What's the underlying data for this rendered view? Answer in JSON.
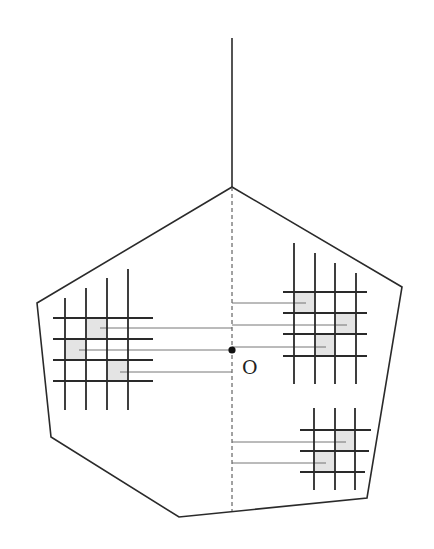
{
  "diagram": {
    "width": 434,
    "height": 549,
    "colors": {
      "stroke": "#2a2a2a",
      "thin": "#555555",
      "shade": "#e4e4e4",
      "background": "#ffffff"
    },
    "stem": {
      "x": 232,
      "y1": 38,
      "y2": 187
    },
    "pentagon": [
      [
        232,
        187
      ],
      [
        402,
        287
      ],
      [
        367,
        498
      ],
      [
        179,
        517
      ],
      [
        51,
        437
      ],
      [
        37,
        303
      ]
    ],
    "axis": {
      "x": 232,
      "y1": 187,
      "y2": 511,
      "style": "dashed"
    },
    "origin": {
      "x": 232,
      "y": 350,
      "label": "O",
      "label_x": 242,
      "label_y": 374
    },
    "grids": [
      {
        "name": "left-grid",
        "verticals": [
          [
            65,
            298,
            410
          ],
          [
            86,
            288,
            410
          ],
          [
            107,
            278,
            410
          ],
          [
            128,
            269,
            410
          ]
        ],
        "horizontals": [
          [
            318,
            53,
            153
          ],
          [
            339,
            53,
            153
          ],
          [
            360,
            53,
            153
          ],
          [
            381,
            53,
            153
          ]
        ],
        "shaded": [
          [
            86,
            318,
            21,
            21
          ],
          [
            65,
            339,
            21,
            21
          ],
          [
            107,
            360,
            21,
            21
          ]
        ],
        "connectors": [
          [
            100,
            328,
            232
          ],
          [
            79,
            350,
            232
          ],
          [
            120,
            372,
            232
          ]
        ]
      },
      {
        "name": "right-top-grid",
        "verticals": [
          [
            294,
            243,
            384
          ],
          [
            315,
            253,
            384
          ],
          [
            335,
            263,
            384
          ],
          [
            356,
            273,
            384
          ]
        ],
        "horizontals": [
          [
            292,
            283,
            367
          ],
          [
            313,
            283,
            367
          ],
          [
            334,
            283,
            367
          ],
          [
            356,
            283,
            367
          ]
        ],
        "shaded": [
          [
            294,
            292,
            21,
            21
          ],
          [
            335,
            313,
            21,
            21
          ],
          [
            315,
            334,
            20,
            22
          ]
        ],
        "connectors": [
          [
            232,
            303,
            306
          ],
          [
            232,
            325,
            347
          ],
          [
            232,
            347,
            326
          ]
        ]
      },
      {
        "name": "right-bottom-grid",
        "verticals": [
          [
            314,
            408,
            490
          ],
          [
            335,
            408,
            490
          ],
          [
            355,
            408,
            490
          ]
        ],
        "horizontals": [
          [
            430,
            300,
            371
          ],
          [
            451,
            300,
            369
          ],
          [
            472,
            300,
            365
          ]
        ],
        "shaded": [
          [
            335,
            430,
            20,
            21
          ],
          [
            314,
            451,
            21,
            21
          ]
        ],
        "connectors": [
          [
            232,
            442,
            346
          ],
          [
            232,
            463,
            326
          ]
        ]
      }
    ]
  }
}
